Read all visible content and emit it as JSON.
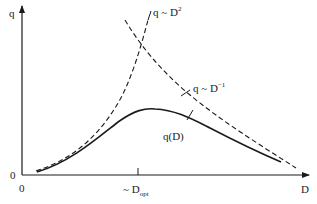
{
  "diagram": {
    "axes": {
      "y_label": "q",
      "x_label": "D",
      "y_origin_label": "0",
      "x_origin_label": "0"
    },
    "tick": {
      "prefix": "~ D",
      "subscript": "opt"
    },
    "curves": {
      "rising_asymptote": {
        "prefix": "q ~ D",
        "exponent": "2",
        "style": "dashed"
      },
      "falling_asymptote": {
        "prefix": "q ~ D",
        "exponent": "−1",
        "style": "dashed"
      },
      "actual": {
        "label": "q(D)",
        "style": "solid"
      }
    },
    "colors": {
      "line": "#1a1a1a",
      "background": "#ffffff"
    }
  }
}
